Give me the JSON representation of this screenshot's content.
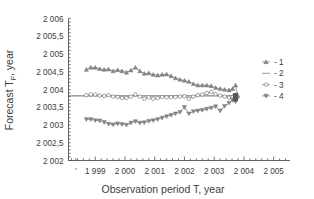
{
  "chart_data": {
    "type": "line",
    "title": "",
    "xlabel": "Observation period T, year",
    "ylabel": "Forecast TF, year",
    "ylabel_base": "Forecast T",
    "ylabel_sub": "F",
    "ylabel_tail": ", year",
    "xlim": [
      1998.1,
      2005.55
    ],
    "ylim": [
      2002.0,
      2006.0
    ],
    "xticks": [
      1999,
      2000,
      2001,
      2002,
      2003,
      2004,
      2005
    ],
    "xticklabels": [
      "1 999",
      "2 000",
      "2 001",
      "2 002",
      "2 003",
      "2 004",
      "2 005"
    ],
    "yticks": [
      2002.0,
      2002.5,
      2003.0,
      2003.5,
      2004.0,
      2004.5,
      2005.0,
      2005.5,
      2006.0
    ],
    "yticklabels": [
      "2 002",
      "2 002,5",
      "2 003",
      "2 003,5",
      "2 004",
      "2 004,5",
      "2 005",
      "2 005,5",
      "2 006"
    ],
    "ytick_minor_step": 0.1,
    "xtick_minor_step": 0.2,
    "grid": false,
    "legend_position": "right",
    "legend": [
      {
        "label": "- 1",
        "marker": "triangle-up",
        "line": true
      },
      {
        "label": "- 2",
        "marker": "none",
        "line": true
      },
      {
        "label": "- 3",
        "marker": "circle",
        "line": true
      },
      {
        "label": "- 4",
        "marker": "triangle-down",
        "line": true
      }
    ],
    "reference_value": 2003.82,
    "series": [
      {
        "name": "- 1",
        "marker": "triangle-up",
        "x": [
          1998.7,
          1998.85,
          1999.0,
          1999.15,
          1999.3,
          1999.45,
          1999.6,
          1999.75,
          1999.9,
          2000.05,
          2000.2,
          2000.35,
          2000.5,
          2000.65,
          2000.8,
          2000.95,
          2001.1,
          2001.25,
          2001.4,
          2001.55,
          2001.7,
          2001.85,
          2002.0,
          2002.15,
          2002.3,
          2002.45,
          2002.6,
          2002.75,
          2002.9,
          2003.05,
          2003.2,
          2003.35,
          2003.5,
          2003.62,
          2003.72,
          2003.78
        ],
        "values": [
          2004.56,
          2004.62,
          2004.62,
          2004.58,
          2004.56,
          2004.57,
          2004.52,
          2004.55,
          2004.52,
          2004.48,
          2004.54,
          2004.62,
          2004.52,
          2004.45,
          2004.46,
          2004.42,
          2004.4,
          2004.42,
          2004.43,
          2004.38,
          2004.32,
          2004.28,
          2004.25,
          2004.22,
          2004.16,
          2004.12,
          2004.12,
          2004.12,
          2004.1,
          2004.05,
          2004.02,
          2004.0,
          2003.98,
          2004.02,
          2004.12,
          2003.85
        ]
      },
      {
        "name": "- 3",
        "marker": "circle",
        "x": [
          1998.7,
          1998.85,
          1999.0,
          1999.15,
          1999.3,
          1999.45,
          1999.6,
          1999.75,
          1999.9,
          2000.05,
          2000.2,
          2000.35,
          2000.5,
          2000.65,
          2000.8,
          2000.95,
          2001.1,
          2001.25,
          2001.4,
          2001.55,
          2001.7,
          2001.85,
          2002.0,
          2002.15,
          2002.3,
          2002.45,
          2002.6,
          2002.75,
          2002.9,
          2003.05,
          2003.2,
          2003.35,
          2003.5,
          2003.62,
          2003.72,
          2003.78
        ],
        "values": [
          2003.84,
          2003.86,
          2003.86,
          2003.83,
          2003.82,
          2003.84,
          2003.8,
          2003.79,
          2003.76,
          2003.76,
          2003.8,
          2003.86,
          2003.8,
          2003.74,
          2003.78,
          2003.74,
          2003.76,
          2003.79,
          2003.78,
          2003.78,
          2003.79,
          2003.8,
          2003.81,
          2003.74,
          2003.8,
          2003.84,
          2003.86,
          2003.9,
          2003.93,
          2003.87,
          2003.83,
          2003.8,
          2003.77,
          2003.79,
          2003.83,
          2003.8
        ]
      },
      {
        "name": "- 4",
        "marker": "triangle-down",
        "x": [
          1998.7,
          1998.85,
          1999.0,
          1999.15,
          1999.3,
          1999.45,
          1999.6,
          1999.75,
          1999.9,
          2000.05,
          2000.2,
          2000.35,
          2000.5,
          2000.65,
          2000.8,
          2000.95,
          2001.1,
          2001.25,
          2001.4,
          2001.55,
          2001.7,
          2001.85,
          2002.0,
          2002.15,
          2002.3,
          2002.45,
          2002.6,
          2002.75,
          2002.9,
          2003.05,
          2003.2,
          2003.35,
          2003.5,
          2003.62,
          2003.72,
          2003.78
        ],
        "values": [
          2003.16,
          2003.16,
          2003.13,
          2003.12,
          2003.08,
          2003.03,
          2003.01,
          2003.04,
          2003.02,
          2003.0,
          2003.06,
          2003.1,
          2003.06,
          2003.07,
          2003.11,
          2003.13,
          2003.16,
          2003.2,
          2003.24,
          2003.28,
          2003.32,
          2003.36,
          2003.5,
          2003.32,
          2003.38,
          2003.4,
          2003.42,
          2003.45,
          2003.48,
          2003.52,
          2003.4,
          2003.53,
          2003.62,
          2003.7,
          2003.66,
          2003.75
        ]
      }
    ]
  }
}
